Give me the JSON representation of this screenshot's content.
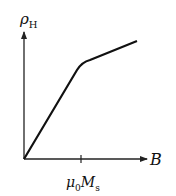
{
  "diagram": {
    "title": "",
    "y_axis": {
      "symbol": "ρ",
      "subscript": "H"
    },
    "x_axis": {
      "symbol": "B"
    },
    "tick": {
      "symbol": "μ",
      "sub1": "0",
      "symbol2": "M",
      "sub2": "s"
    },
    "curve": {
      "description": "Hall resistivity vs magnetic field: linear steep rise from origin up to B = μ0Ms, then a knee and a shallower linear slope",
      "points": [
        [
          0,
          0
        ],
        [
          1,
          0.76
        ],
        [
          2,
          0.95
        ]
      ]
    },
    "colors": {
      "line": "#111111",
      "background": "#ffffff"
    }
  }
}
